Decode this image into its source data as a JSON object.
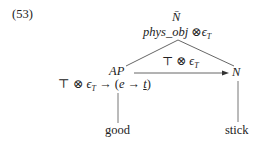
{
  "example_number": "(53)",
  "root": {
    "category": "N̄",
    "type_prefix": "phys_obj",
    "type_op": "⊗",
    "type_eps": "ϵ",
    "type_eps_sub": "T"
  },
  "edge_label": {
    "top": "⊤",
    "op": "⊗",
    "eps": "ϵ",
    "eps_sub": "T"
  },
  "left_node": {
    "category": "AP",
    "type_top": "⊤",
    "type_op": "⊗",
    "type_eps": "ϵ",
    "type_eps_sub": "T",
    "type_arrow": "→",
    "type_paren_open": "(",
    "type_e": "e",
    "type_arrow2": "→",
    "type_t": "t",
    "type_paren_close": ")",
    "leaf": "good"
  },
  "right_node": {
    "category": "N",
    "leaf": "stick"
  },
  "colors": {
    "text": "#222222",
    "line": "#555555",
    "background": "#ffffff"
  }
}
